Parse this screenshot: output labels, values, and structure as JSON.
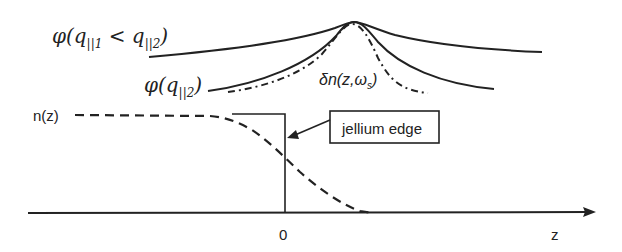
{
  "diagram": {
    "labels": {
      "phi_outer": "φ(q",
      "phi_outer_sub1": "||1",
      "phi_outer_lt": " < q",
      "phi_outer_sub2": "||2",
      "phi_outer_close": ")",
      "phi_inner": "φ(q",
      "phi_inner_sub": "||2",
      "phi_inner_close": ")",
      "delta_n": "δn(z,ω",
      "delta_n_sub": "s",
      "delta_n_close": ")",
      "n_z": "n(z)",
      "origin": "0",
      "z_axis": "z",
      "callout": "jellium edge"
    },
    "curves": [
      {
        "name": "phi(q||1 < q||2)",
        "style": "solid",
        "width": "broad"
      },
      {
        "name": "phi(q||2)",
        "style": "solid",
        "width": "narrower"
      },
      {
        "name": "delta n(z, omega_s)",
        "style": "dash-dot",
        "width": "narrowest"
      },
      {
        "name": "n(z)",
        "style": "dashed",
        "shape": "smooth step decay near z=0"
      },
      {
        "name": "jellium step",
        "style": "solid",
        "shape": "sharp step at z=0"
      }
    ],
    "colors": {
      "line": "#222222",
      "background": "#ffffff"
    }
  }
}
